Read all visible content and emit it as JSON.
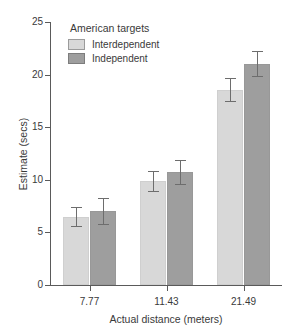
{
  "chart_data": {
    "type": "bar",
    "title": "",
    "xlabel": "Actual distance (meters)",
    "ylabel": "Estimate (secs)",
    "categories": [
      "7.77",
      "11.43",
      "21.49"
    ],
    "ylim": [
      0,
      25
    ],
    "yticks": [
      "0",
      "5",
      "10",
      "15",
      "20",
      "25"
    ],
    "grid": false,
    "legend_position": "top-left",
    "legend_title": "American targets",
    "series": [
      {
        "name": "Interdependent",
        "color": "#d8d8d8",
        "values": [
          6.5,
          9.85,
          18.5
        ],
        "errors": [
          0.95,
          1.0,
          1.15
        ]
      },
      {
        "name": "Independent",
        "color": "#9e9e9e",
        "values": [
          7.0,
          10.7,
          21.0
        ],
        "errors": [
          1.25,
          1.15,
          1.25
        ]
      }
    ]
  },
  "axes": {
    "y_title": "Estimate (secs)",
    "x_title": "Actual distance (meters)",
    "y_ticks": [
      "0",
      "5",
      "10",
      "15",
      "20",
      "25"
    ],
    "x_ticks": [
      "7.77",
      "11.43",
      "21.49"
    ]
  },
  "legend": {
    "title": "American targets",
    "entries": [
      {
        "label": "Interdependent",
        "swatch": "light"
      },
      {
        "label": "Independent",
        "swatch": "dark"
      }
    ]
  }
}
